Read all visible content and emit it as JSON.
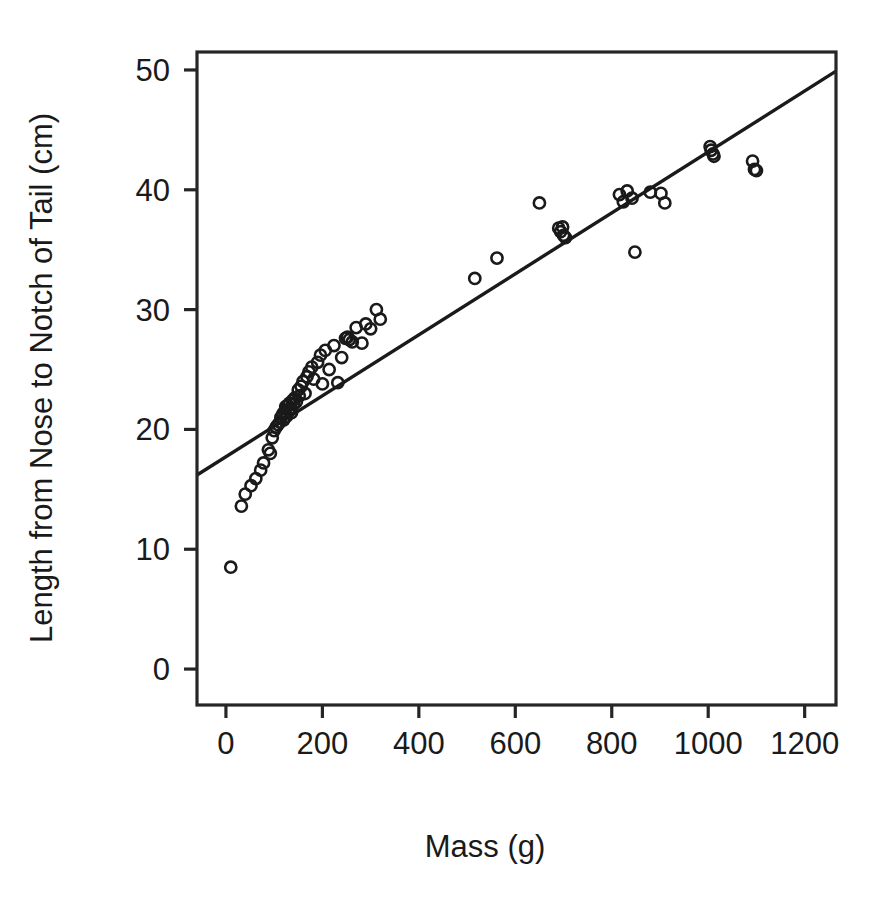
{
  "chart_data": {
    "type": "scatter",
    "title": "",
    "xlabel": "Mass (g)",
    "ylabel": "Length from Nose to Notch of Tail (cm)",
    "xlim": [
      -60,
      1265
    ],
    "ylim": [
      -3.0,
      51.5
    ],
    "xticks": [
      0,
      200,
      400,
      600,
      800,
      1000,
      1200
    ],
    "yticks": [
      0,
      10,
      20,
      30,
      40,
      50
    ],
    "xtick_labels": [
      "0",
      "200",
      "400",
      "600",
      "800",
      "1000",
      "1200"
    ],
    "ytick_labels": [
      "0",
      "10",
      "20",
      "30",
      "40",
      "50"
    ],
    "grid": false,
    "legend": false,
    "legend_position": "none",
    "marker": "open-circle",
    "marker_color": "#1a1a1a",
    "line_color": "#1a1a1a",
    "box_frame": true,
    "trendline": {
      "type": "linear-fit",
      "x": [
        -60,
        1265
      ],
      "y": [
        16.2,
        49.9
      ],
      "slope": 0.02543,
      "intercept": 17.73
    },
    "x": [
      10,
      32,
      40,
      52,
      62,
      72,
      78,
      88,
      92,
      96,
      100,
      104,
      108,
      112,
      114,
      118,
      120,
      122,
      124,
      126,
      128,
      130,
      132,
      134,
      136,
      138,
      140,
      142,
      146,
      150,
      152,
      156,
      160,
      164,
      168,
      172,
      178,
      182,
      190,
      196,
      200,
      206,
      214,
      224,
      232,
      240,
      248,
      252,
      256,
      262,
      270,
      282,
      290,
      300,
      312,
      320,
      516,
      562,
      650,
      690,
      694,
      698,
      700,
      704,
      816,
      824,
      832,
      842,
      848,
      880,
      902,
      910,
      1004,
      1006,
      1010,
      1012,
      1092,
      1096,
      1100
    ],
    "y": [
      8.5,
      13.6,
      14.6,
      15.3,
      15.9,
      16.6,
      17.2,
      18.3,
      18.0,
      19.3,
      19.9,
      20.2,
      20.4,
      20.6,
      21.0,
      21.3,
      20.8,
      21.5,
      21.9,
      21.1,
      22.0,
      21.6,
      22.2,
      21.8,
      21.4,
      22.4,
      22.1,
      22.6,
      22.3,
      23.3,
      22.8,
      23.6,
      24.0,
      23.0,
      24.4,
      24.8,
      25.2,
      24.2,
      25.6,
      26.2,
      23.8,
      26.6,
      25.0,
      27.0,
      23.9,
      26.0,
      27.6,
      27.7,
      27.5,
      27.3,
      28.5,
      27.2,
      28.8,
      28.4,
      30.0,
      29.2,
      32.6,
      34.3,
      38.9,
      36.8,
      36.5,
      36.9,
      36.2,
      36.0,
      39.6,
      39.0,
      39.9,
      39.3,
      34.8,
      39.8,
      39.7,
      38.9,
      43.6,
      43.3,
      43.0,
      42.8,
      42.4,
      41.7,
      41.6
    ]
  }
}
